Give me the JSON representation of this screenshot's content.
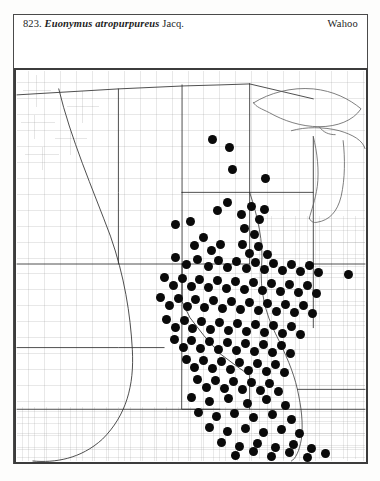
{
  "plate": {
    "number": "823.",
    "scientific_name": "Euonymus atropurpureus",
    "authority": "Jacq.",
    "common_name": "Wahoo",
    "map_type": "county-dot-distribution-map",
    "region": "north-central-united-states"
  },
  "colors": {
    "ink": "#1d1d1d",
    "dot": "#0a0a0a",
    "county_line": "#9a9a9a",
    "state_line": "#2e2e2e",
    "frame": "#3c3c3c",
    "water": "#6f6f6f",
    "paper": "#ffffff"
  },
  "chart_data": {
    "type": "scatter",
    "xlabel": "",
    "ylabel": "",
    "xlim": [
      0,
      354
    ],
    "ylim": [
      0,
      396
    ],
    "grid": false,
    "legend": "none",
    "annotations": [
      "County-level presence dots over a multi-state base map",
      "Great Lakes shorelines drawn at upper right",
      "Missouri River drawn as curved line through western plains"
    ],
    "marker": {
      "shape": "circle",
      "diameter_px": 9,
      "color": "#0a0a0a"
    },
    "points": [
      [
        199,
        71
      ],
      [
        216,
        79
      ],
      [
        219,
        101
      ],
      [
        252,
        110
      ],
      [
        161,
        156
      ],
      [
        176,
        153
      ],
      [
        204,
        142
      ],
      [
        214,
        134
      ],
      [
        228,
        146
      ],
      [
        238,
        138
      ],
      [
        246,
        151
      ],
      [
        251,
        141
      ],
      [
        231,
        160
      ],
      [
        241,
        166
      ],
      [
        190,
        169
      ],
      [
        181,
        177
      ],
      [
        198,
        182
      ],
      [
        207,
        176
      ],
      [
        229,
        176
      ],
      [
        236,
        185
      ],
      [
        245,
        178
      ],
      [
        254,
        186
      ],
      [
        161,
        189
      ],
      [
        172,
        196
      ],
      [
        184,
        191
      ],
      [
        195,
        199
      ],
      [
        205,
        192
      ],
      [
        214,
        200
      ],
      [
        223,
        193
      ],
      [
        233,
        201
      ],
      [
        242,
        194
      ],
      [
        251,
        202
      ],
      [
        260,
        195
      ],
      [
        269,
        203
      ],
      [
        278,
        196
      ],
      [
        287,
        204
      ],
      [
        296,
        197
      ],
      [
        305,
        205
      ],
      [
        335,
        207
      ],
      [
        150,
        210
      ],
      [
        159,
        218
      ],
      [
        168,
        211
      ],
      [
        177,
        219
      ],
      [
        186,
        212
      ],
      [
        195,
        220
      ],
      [
        204,
        213
      ],
      [
        213,
        221
      ],
      [
        222,
        214
      ],
      [
        231,
        222
      ],
      [
        240,
        215
      ],
      [
        249,
        223
      ],
      [
        258,
        216
      ],
      [
        267,
        224
      ],
      [
        276,
        217
      ],
      [
        285,
        225
      ],
      [
        294,
        218
      ],
      [
        303,
        226
      ],
      [
        146,
        230
      ],
      [
        155,
        238
      ],
      [
        164,
        231
      ],
      [
        173,
        239
      ],
      [
        182,
        232
      ],
      [
        191,
        240
      ],
      [
        200,
        233
      ],
      [
        209,
        241
      ],
      [
        218,
        234
      ],
      [
        227,
        242
      ],
      [
        236,
        235
      ],
      [
        245,
        243
      ],
      [
        254,
        236
      ],
      [
        263,
        244
      ],
      [
        272,
        237
      ],
      [
        281,
        245
      ],
      [
        290,
        238
      ],
      [
        299,
        246
      ],
      [
        152,
        252
      ],
      [
        161,
        260
      ],
      [
        170,
        253
      ],
      [
        179,
        261
      ],
      [
        188,
        254
      ],
      [
        197,
        262
      ],
      [
        206,
        255
      ],
      [
        215,
        263
      ],
      [
        224,
        256
      ],
      [
        233,
        264
      ],
      [
        242,
        257
      ],
      [
        251,
        265
      ],
      [
        260,
        258
      ],
      [
        269,
        266
      ],
      [
        278,
        259
      ],
      [
        287,
        267
      ],
      [
        160,
        272
      ],
      [
        169,
        280
      ],
      [
        178,
        273
      ],
      [
        187,
        281
      ],
      [
        196,
        274
      ],
      [
        205,
        282
      ],
      [
        214,
        275
      ],
      [
        223,
        283
      ],
      [
        232,
        276
      ],
      [
        241,
        284
      ],
      [
        250,
        277
      ],
      [
        259,
        285
      ],
      [
        268,
        278
      ],
      [
        277,
        286
      ],
      [
        172,
        292
      ],
      [
        181,
        300
      ],
      [
        190,
        293
      ],
      [
        199,
        301
      ],
      [
        208,
        294
      ],
      [
        217,
        302
      ],
      [
        226,
        295
      ],
      [
        235,
        303
      ],
      [
        244,
        296
      ],
      [
        253,
        304
      ],
      [
        262,
        297
      ],
      [
        271,
        305
      ],
      [
        184,
        312
      ],
      [
        193,
        320
      ],
      [
        202,
        313
      ],
      [
        211,
        321
      ],
      [
        220,
        314
      ],
      [
        229,
        322
      ],
      [
        238,
        315
      ],
      [
        247,
        323
      ],
      [
        256,
        316
      ],
      [
        265,
        324
      ],
      [
        177,
        330
      ],
      [
        196,
        334
      ],
      [
        215,
        331
      ],
      [
        234,
        336
      ],
      [
        253,
        332
      ],
      [
        272,
        338
      ],
      [
        185,
        345
      ],
      [
        203,
        349
      ],
      [
        221,
        346
      ],
      [
        240,
        350
      ],
      [
        259,
        347
      ],
      [
        278,
        352
      ],
      [
        196,
        360
      ],
      [
        214,
        364
      ],
      [
        232,
        361
      ],
      [
        250,
        365
      ],
      [
        268,
        362
      ],
      [
        286,
        366
      ],
      [
        208,
        375
      ],
      [
        226,
        379
      ],
      [
        244,
        376
      ],
      [
        262,
        380
      ],
      [
        280,
        377
      ],
      [
        298,
        381
      ],
      [
        222,
        388
      ],
      [
        240,
        384
      ],
      [
        258,
        389
      ],
      [
        276,
        385
      ],
      [
        294,
        390
      ],
      [
        312,
        386
      ]
    ]
  }
}
